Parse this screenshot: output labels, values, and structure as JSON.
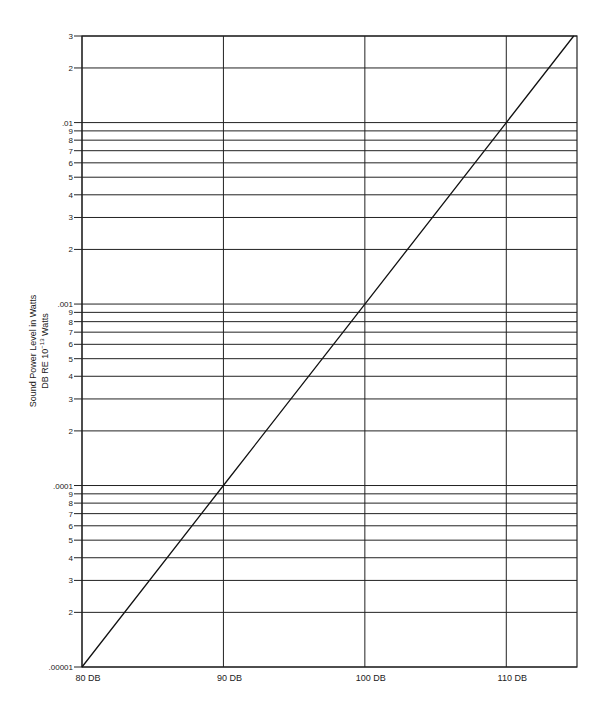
{
  "chart_data": {
    "type": "line",
    "title": "",
    "xlabel": "",
    "ylabel": "Sound Power Level in Watts",
    "ylabel_line2": "DB RE 10^-13 Watts",
    "ylabel_line2_parts": {
      "base": "DB RE 10",
      "exp": "−13",
      "tail": " Watts"
    },
    "x_scale": "linear",
    "y_scale": "log",
    "xlim": [
      80,
      115
    ],
    "ylim": [
      1e-05,
      0.03
    ],
    "grid": true,
    "x_ticks": [
      {
        "value": 80,
        "label": "80 DB"
      },
      {
        "value": 90,
        "label": "90 DB"
      },
      {
        "value": 100,
        "label": "100 DB"
      },
      {
        "value": 110,
        "label": "110 DB"
      }
    ],
    "y_ticks": [
      {
        "value": 0.03,
        "label": "3"
      },
      {
        "value": 0.02,
        "label": "2"
      },
      {
        "value": 0.01,
        "label": ".01"
      },
      {
        "value": 0.009,
        "label": "9"
      },
      {
        "value": 0.008,
        "label": "8"
      },
      {
        "value": 0.007,
        "label": "7"
      },
      {
        "value": 0.006,
        "label": "6"
      },
      {
        "value": 0.005,
        "label": "5"
      },
      {
        "value": 0.004,
        "label": "4"
      },
      {
        "value": 0.003,
        "label": "3"
      },
      {
        "value": 0.002,
        "label": "2"
      },
      {
        "value": 0.001,
        "label": ".001"
      },
      {
        "value": 0.0009,
        "label": "9"
      },
      {
        "value": 0.0008,
        "label": "8"
      },
      {
        "value": 0.0007,
        "label": "7"
      },
      {
        "value": 0.0006,
        "label": "6"
      },
      {
        "value": 0.0005,
        "label": "5"
      },
      {
        "value": 0.0004,
        "label": "4"
      },
      {
        "value": 0.0003,
        "label": "3"
      },
      {
        "value": 0.0002,
        "label": "2"
      },
      {
        "value": 0.0001,
        "label": ".0001"
      },
      {
        "value": 9e-05,
        "label": "9"
      },
      {
        "value": 8e-05,
        "label": "8"
      },
      {
        "value": 7e-05,
        "label": "7"
      },
      {
        "value": 6e-05,
        "label": "6"
      },
      {
        "value": 5e-05,
        "label": "5"
      },
      {
        "value": 4e-05,
        "label": "4"
      },
      {
        "value": 3e-05,
        "label": "3"
      },
      {
        "value": 2e-05,
        "label": "2"
      },
      {
        "value": 1e-05,
        "label": ".00001"
      }
    ],
    "series": [
      {
        "name": "Sound power (W) vs level (dB re 10^-13 W)",
        "x": [
          80,
          90,
          100,
          110,
          114.77
        ],
        "y": [
          1e-05,
          0.0001,
          0.001,
          0.01,
          0.03
        ]
      }
    ],
    "legend": null
  }
}
